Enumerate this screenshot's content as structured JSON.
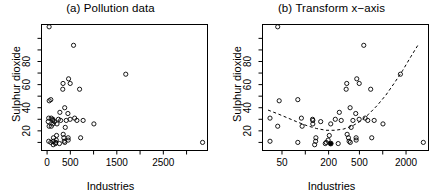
{
  "figure": {
    "width": 442,
    "height": 193,
    "background": "#ffffff",
    "foreground": "#000000",
    "point_symbol": "open-circle",
    "highlight_symbol": "filled-circle"
  },
  "chart_data": [
    {
      "type": "scatter",
      "panel": "a",
      "title": "(a) Pollution data",
      "xlabel": "Industries",
      "ylabel": "Sulphur dioxide",
      "xscale": "linear",
      "yscale": "linear",
      "xlim": [
        -120,
        3450
      ],
      "ylim": [
        3,
        112
      ],
      "grid": false,
      "legend": null,
      "xticks_labeled": [
        0,
        500,
        1500,
        2500
      ],
      "xticks_all": [
        0,
        500,
        1000,
        1500,
        2000,
        2500,
        3000
      ],
      "yticks_labeled": [
        20,
        40,
        60,
        80
      ],
      "yticks_all": [
        10,
        20,
        30,
        40,
        50,
        60,
        70,
        80,
        90,
        100
      ],
      "x": [
        46,
        35,
        44,
        80,
        136,
        35,
        44,
        391,
        462,
        1007,
        266,
        80,
        24,
        89,
        125,
        291,
        593,
        204,
        125,
        137,
        453,
        454,
        412,
        699,
        775,
        181,
        347,
        448,
        361,
        368,
        3344,
        337,
        275,
        641,
        721,
        381,
        91,
        186,
        132,
        496,
        1692,
        343,
        197,
        379,
        124,
        244,
        497,
        569,
        213,
        158
      ],
      "y": [
        46,
        11,
        24,
        47,
        11,
        31,
        110,
        23,
        65,
        26,
        9,
        10,
        28,
        31,
        26,
        29,
        31,
        16,
        29,
        14,
        14,
        12,
        29,
        56,
        29,
        9,
        17,
        35,
        14,
        11,
        10,
        56,
        36,
        29,
        14,
        10,
        24,
        10,
        8,
        30,
        69,
        61,
        12,
        40,
        30,
        30,
        61,
        94,
        26,
        28
      ],
      "n_points": 50,
      "note": "Sulphur dioxide concentration versus number of manufacturing industries employing >=20 workers, US cities."
    },
    {
      "type": "scatter",
      "panel": "b",
      "title": "(b) Transform x−axis",
      "xlabel": "Industries",
      "ylabel": "Sulphur dioxide",
      "xscale": "log",
      "yscale": "linear",
      "xlim": [
        28,
        3900
      ],
      "ylim": [
        3,
        112
      ],
      "grid": false,
      "legend": null,
      "xticks_labeled": [
        50,
        200,
        500,
        2000
      ],
      "xticks_all": [
        50,
        100,
        200,
        500,
        1000,
        2000
      ],
      "yticks_labeled": [
        20,
        40,
        60,
        80
      ],
      "yticks_all": [
        10,
        20,
        30,
        40,
        50,
        60,
        70,
        80,
        90,
        100
      ],
      "x": [
        46,
        35,
        44,
        80,
        136,
        35,
        44,
        391,
        462,
        1007,
        266,
        80,
        24,
        89,
        125,
        291,
        593,
        204,
        125,
        137,
        453,
        454,
        412,
        699,
        775,
        181,
        347,
        448,
        361,
        368,
        3344,
        337,
        275,
        641,
        721,
        381,
        91,
        186,
        132,
        496,
        1692,
        343,
        197,
        379,
        124,
        244,
        497,
        569,
        213,
        158
      ],
      "y": [
        46,
        11,
        24,
        47,
        11,
        31,
        110,
        23,
        65,
        26,
        9,
        10,
        28,
        31,
        26,
        29,
        31,
        16,
        29,
        14,
        14,
        12,
        29,
        56,
        29,
        9,
        17,
        35,
        14,
        11,
        10,
        56,
        36,
        29,
        14,
        10,
        24,
        10,
        8,
        30,
        69,
        61,
        12,
        40,
        30,
        30,
        61,
        94,
        26,
        28
      ],
      "n_points": 50,
      "series": [
        {
          "name": "smoothed-trend",
          "style": "dashed",
          "x": [
            33,
            45,
            60,
            80,
            105,
            140,
            185,
            240,
            310,
            400,
            520,
            660,
            850,
            1100,
            1400,
            1800,
            2300,
            2900
          ],
          "y": [
            38,
            34.5,
            31,
            27.5,
            24.5,
            22,
            20.5,
            20.5,
            21.5,
            24,
            28.5,
            34.5,
            42,
            51,
            61,
            72,
            84,
            95
          ]
        }
      ],
      "highlight_point": {
        "x": 213,
        "y": 9,
        "style": "filled"
      },
      "note": "Same data with logarithmic x-axis and a dashed smooth (lowess) trend curve."
    }
  ]
}
